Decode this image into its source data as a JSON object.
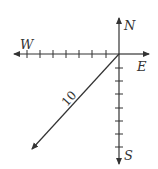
{
  "diagram": {
    "type": "compass-vector",
    "labels": {
      "north": "N",
      "south": "S",
      "east": "E",
      "west": "W"
    },
    "vector": {
      "magnitude_label": "10",
      "direction": "southwest"
    },
    "ticks": {
      "west_count": 7,
      "south_count": 7
    },
    "colors": {
      "line": "#333333",
      "background": "#ffffff"
    }
  }
}
